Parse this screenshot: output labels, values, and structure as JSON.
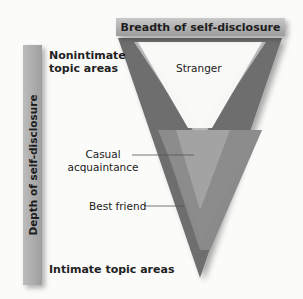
{
  "diagram": {
    "horizontal_axis_label": "Breadth of self-disclosure",
    "vertical_axis_label": "Depth of self-disclosure",
    "top_label": "Nonintimate topic areas",
    "bottom_label": "Intimate topic areas",
    "relationship_levels": [
      {
        "label": "Stranger"
      },
      {
        "label": "Casual acquaintance"
      },
      {
        "label": "Best friend"
      }
    ],
    "colors": {
      "outer_v": "#6f6f6f",
      "middle_v": "#8e8e8e",
      "inner_v": "#bdbdbd",
      "bars": "#aaaaaa"
    }
  }
}
